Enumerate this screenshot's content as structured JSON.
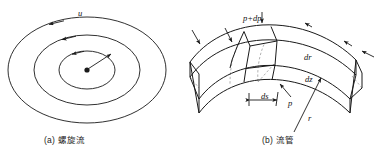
{
  "figure": {
    "panels": [
      {
        "id": "panel-a",
        "caption": "(a) 螺旋流",
        "labels": [
          {
            "name": "velocity",
            "text": "u"
          }
        ]
      },
      {
        "id": "panel-b",
        "caption": "(b) 流管",
        "labels": [
          {
            "name": "pressure-outer",
            "text": "p+dp"
          },
          {
            "name": "radial-thickness",
            "text": "dr"
          },
          {
            "name": "axial-thickness",
            "text": "dz"
          },
          {
            "name": "arc-length",
            "text": "ds"
          },
          {
            "name": "pressure-inner",
            "text": "p"
          },
          {
            "name": "radius",
            "text": "r"
          }
        ]
      }
    ],
    "style": {
      "stroke": "#1a1a1a",
      "background": "#ffffff",
      "dashed": "#9a9a9a"
    }
  }
}
